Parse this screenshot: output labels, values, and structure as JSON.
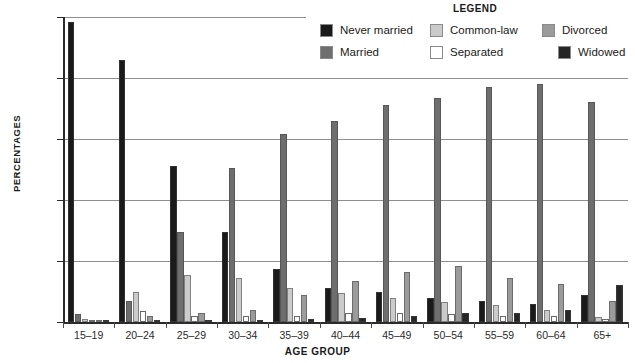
{
  "legend": {
    "title": "LEGEND",
    "items": [
      {
        "label": "Never married",
        "color": "#1a1a1a"
      },
      {
        "label": "Common-law",
        "color": "#cbcbcb"
      },
      {
        "label": "Divorced",
        "color": "#9b9b9b"
      },
      {
        "label": "Married",
        "color": "#6e6e6e"
      },
      {
        "label": "Separated",
        "color": "#ffffff"
      },
      {
        "label": "Widowed",
        "color": "#262626"
      }
    ]
  },
  "axes": {
    "y_title": "PERCENTAGES",
    "x_title": "AGE GROUP",
    "y_ticks": [
      "0%",
      "20%",
      "40%",
      "60%",
      "80%",
      "100%"
    ]
  },
  "chart_data": {
    "type": "bar",
    "title": "",
    "xlabel": "AGE GROUP",
    "ylabel": "PERCENTAGES",
    "ylim": [
      0,
      100
    ],
    "ytick_values": [
      0,
      20,
      40,
      60,
      80,
      100
    ],
    "grid": true,
    "legend_position": "top-right",
    "categories": [
      "15–19",
      "20–24",
      "25–29",
      "30–34",
      "35–39",
      "40–44",
      "45–49",
      "50–54",
      "55–59",
      "60–64",
      "65+"
    ],
    "series": [
      {
        "name": "Never married",
        "color": "#1a1a1a",
        "values": [
          98.5,
          86,
          51,
          29.5,
          17.5,
          11,
          10,
          8,
          7,
          6,
          9
        ]
      },
      {
        "name": "Married",
        "color": "#6e6e6e",
        "values": [
          2.5,
          7,
          29.5,
          50.5,
          61.5,
          66,
          71,
          73.5,
          77,
          78,
          72
        ]
      },
      {
        "name": "Common-law",
        "color": "#cbcbcb",
        "values": [
          1,
          10,
          15.5,
          14.5,
          11,
          9.5,
          8,
          6.5,
          5.5,
          4,
          1.5
        ]
      },
      {
        "name": "Separated",
        "color": "#ffffff",
        "values": [
          0.2,
          3.5,
          2,
          2,
          2,
          3,
          3,
          2.5,
          2,
          2,
          1
        ]
      },
      {
        "name": "Divorced",
        "color": "#9b9b9b",
        "values": [
          0.3,
          2,
          3,
          4,
          9,
          13.5,
          16.5,
          18.5,
          14.5,
          12.5,
          7
        ]
      },
      {
        "name": "Widowed",
        "color": "#262626",
        "values": [
          0.1,
          0.3,
          0.5,
          0.8,
          1,
          1.2,
          2,
          3,
          3,
          4,
          12
        ]
      }
    ]
  }
}
